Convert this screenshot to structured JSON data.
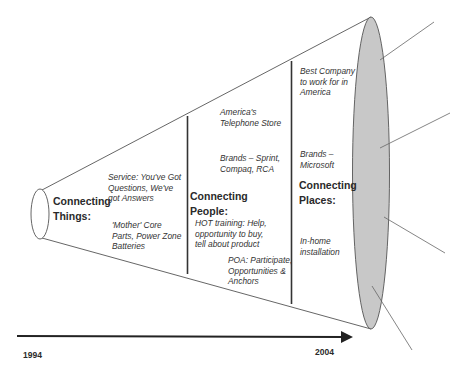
{
  "diagram": {
    "timeline": {
      "start_year": "1994",
      "end_year": "2004"
    },
    "stages": [
      {
        "title_line1": "Connecting",
        "title_line2": "Things:",
        "items": [
          {
            "lines": [
              "Service:  You've Got",
              "Questions, We've",
              "got Answers"
            ]
          },
          {
            "lines": [
              "'Mother' Core",
              "Parts, Power Zone",
              "Batteries"
            ]
          }
        ]
      },
      {
        "title_line1": "Connecting",
        "title_line2": "People:",
        "items": [
          {
            "lines": [
              "America's",
              "Telephone Store"
            ]
          },
          {
            "lines": [
              "Brands – Sprint,",
              "Compaq, RCA"
            ]
          },
          {
            "lines": [
              "HOT training:  Help,",
              "opportunity to buy,",
              "tell about product"
            ]
          },
          {
            "lines": [
              "POA:  Participate,",
              "Opportunities &",
              "Anchors"
            ]
          }
        ]
      },
      {
        "title_line1": "Connecting",
        "title_line2": "Places:",
        "items": [
          {
            "lines": [
              "Best Company",
              "to work for in",
              "America"
            ]
          },
          {
            "lines": [
              "Brands –",
              "Microsoft"
            ]
          },
          {
            "lines": [
              "In-home",
              "installation"
            ]
          }
        ]
      }
    ],
    "colors": {
      "outline": "#555555",
      "end_ellipse_fill": "#c8c8c8",
      "arrow": "#222222",
      "text": "#333333"
    }
  }
}
